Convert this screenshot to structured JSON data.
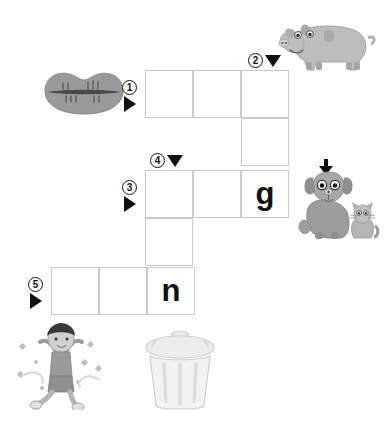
{
  "page": {
    "background_color": "#ffffff"
  },
  "palette": {
    "grid_line": "#c9c9c9",
    "letter_color": "#111111",
    "marker_color": "#111111",
    "art_gray_dark": "#8f8f8f",
    "art_gray_mid": "#a8a8a8",
    "art_gray_light": "#cfcfcf",
    "art_gray_pale": "#e4e4e4"
  },
  "grid": {
    "cell_size": 48,
    "cells": [
      {
        "id": "r1c1",
        "x": 145,
        "y": 70,
        "letter": ""
      },
      {
        "id": "r1c2",
        "x": 193,
        "y": 70,
        "letter": ""
      },
      {
        "id": "r1c3",
        "x": 241,
        "y": 70,
        "letter": ""
      },
      {
        "id": "r2c3",
        "x": 241,
        "y": 118,
        "letter": ""
      },
      {
        "id": "r3c1",
        "x": 145,
        "y": 170,
        "letter": ""
      },
      {
        "id": "r3c2",
        "x": 193,
        "y": 170,
        "letter": ""
      },
      {
        "id": "r3c3",
        "x": 241,
        "y": 170,
        "letter": "g"
      },
      {
        "id": "r4c1",
        "x": 145,
        "y": 218,
        "letter": ""
      },
      {
        "id": "r5c1",
        "x": 51,
        "y": 267,
        "letter": ""
      },
      {
        "id": "r5c2",
        "x": 99,
        "y": 267,
        "letter": ""
      },
      {
        "id": "r5c3",
        "x": 147,
        "y": 267,
        "letter": "n"
      }
    ]
  },
  "clues": [
    {
      "id": "clue-1",
      "number": "1",
      "direction": "across",
      "arrow": "right-triangle",
      "x": 122,
      "y": 80
    },
    {
      "id": "clue-2",
      "number": "2",
      "direction": "down",
      "arrow": "down-triangle",
      "x": 248,
      "y": 53
    },
    {
      "id": "clue-3",
      "number": "3",
      "direction": "across",
      "arrow": "right-triangle",
      "x": 122,
      "y": 180
    },
    {
      "id": "clue-4",
      "number": "4",
      "direction": "down",
      "arrow": "down-triangle",
      "x": 150,
      "y": 153
    },
    {
      "id": "clue-5",
      "number": "5",
      "direction": "across",
      "arrow": "right-triangle",
      "x": 28,
      "y": 277
    }
  ],
  "illustrations": [
    {
      "id": "lips",
      "name": "lips-picture",
      "x": 42,
      "y": 62,
      "w": 84,
      "h": 58
    },
    {
      "id": "pig",
      "name": "pig-picture",
      "x": 272,
      "y": 12,
      "w": 106,
      "h": 66
    },
    {
      "id": "dog-cat",
      "name": "dog-and-cat-picture",
      "x": 297,
      "y": 158,
      "w": 86,
      "h": 88
    },
    {
      "id": "child",
      "name": "jumping-child-picture",
      "x": 12,
      "y": 322,
      "w": 98,
      "h": 88
    },
    {
      "id": "trash-can",
      "name": "trash-can-picture",
      "x": 136,
      "y": 326,
      "w": 88,
      "h": 86
    }
  ]
}
